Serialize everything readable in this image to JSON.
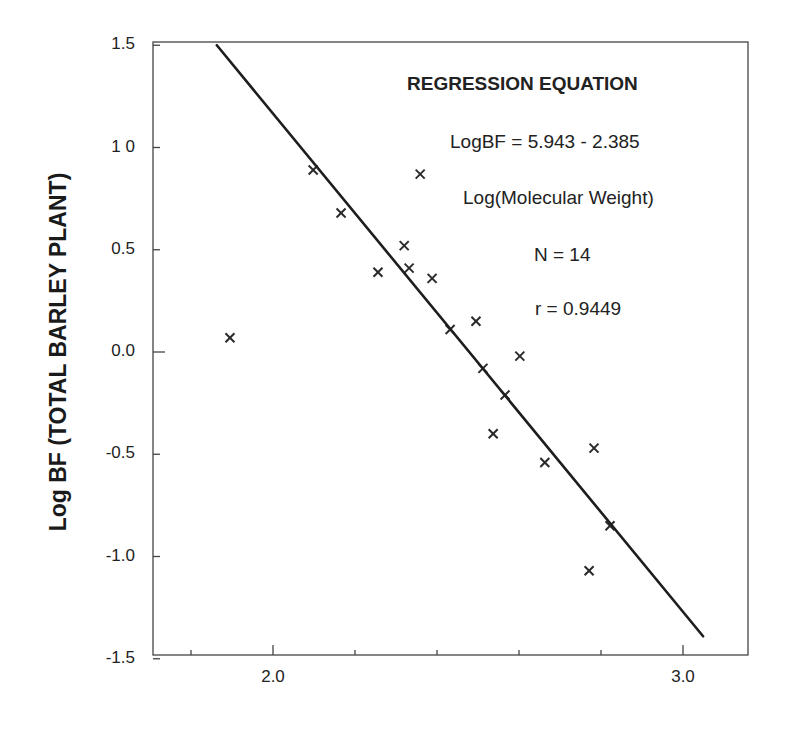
{
  "chart_data": {
    "type": "scatter",
    "title": "",
    "xlabel": "",
    "ylabel": "Log BF (TOTAL BARLEY PLANT)",
    "xlim": [
      1.707,
      3.16
    ],
    "ylim": [
      -1.5,
      1.5
    ],
    "grid": false,
    "x_ticks": [
      {
        "value": 1.8,
        "label": ""
      },
      {
        "value": 2.0,
        "label": "2.0"
      },
      {
        "value": 2.2,
        "label": ""
      },
      {
        "value": 2.4,
        "label": ""
      },
      {
        "value": 2.6,
        "label": ""
      },
      {
        "value": 2.8,
        "label": ""
      },
      {
        "value": 3.0,
        "label": "3.0"
      }
    ],
    "y_ticks": [
      {
        "value": 1.5,
        "label": "1.5"
      },
      {
        "value": 1.0,
        "label": "1 0"
      },
      {
        "value": 0.5,
        "label": "0.5"
      },
      {
        "value": 0.0,
        "label": "0.0"
      },
      {
        "value": -0.5,
        "label": "-0.5"
      },
      {
        "value": -1.0,
        "label": "-1.0"
      },
      {
        "value": -1.5,
        "label": "-1.5"
      }
    ],
    "series": [
      {
        "name": "observations",
        "marker": "x",
        "points": [
          {
            "x": 1.895,
            "y": 0.07
          },
          {
            "x": 2.098,
            "y": 0.89
          },
          {
            "x": 2.166,
            "y": 0.68
          },
          {
            "x": 2.256,
            "y": 0.39
          },
          {
            "x": 2.32,
            "y": 0.52
          },
          {
            "x": 2.332,
            "y": 0.41
          },
          {
            "x": 2.359,
            "y": 0.87
          },
          {
            "x": 2.388,
            "y": 0.36
          },
          {
            "x": 2.432,
            "y": 0.11
          },
          {
            "x": 2.495,
            "y": 0.15
          },
          {
            "x": 2.512,
            "y": -0.08
          },
          {
            "x": 2.566,
            "y": -0.21
          },
          {
            "x": 2.537,
            "y": -0.4
          },
          {
            "x": 2.602,
            "y": -0.02
          },
          {
            "x": 2.663,
            "y": -0.54
          },
          {
            "x": 2.783,
            "y": -0.47
          },
          {
            "x": 2.771,
            "y": -1.07
          },
          {
            "x": 2.822,
            "y": -0.85
          }
        ]
      },
      {
        "name": "regression line",
        "type": "line",
        "points": [
          {
            "x": 1.863,
            "y": 1.5
          },
          {
            "x": 3.049,
            "y": -1.39
          }
        ]
      }
    ],
    "annotations": {
      "title": "REGRESSION EQUATION",
      "equation_line1": "LogBF = 5.943 - 2.385",
      "equation_line2": "Log(Molecular Weight)",
      "n": "N = 14",
      "r": "r = 0.9449"
    }
  }
}
